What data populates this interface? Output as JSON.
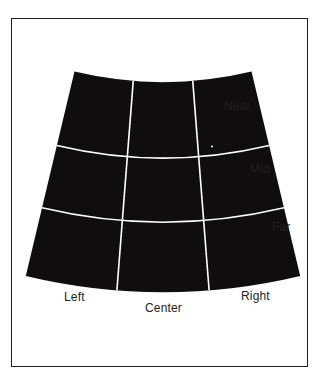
{
  "figure": {
    "frame": {
      "border_color": "#231f20",
      "background_color": "#ffffff"
    },
    "shape": {
      "fill_color": "#100d0e",
      "grid_line_color": "#ffffff",
      "grid_line_width": 1.6,
      "apex_x": 163,
      "apex_y": -300,
      "top_radius": 382,
      "arc1_radius": 458,
      "arc2_radius": 522,
      "bottom_radius": 592,
      "half_angle_deg": 13.4
    },
    "labels": {
      "depth": [
        {
          "id": "near",
          "text": "Near"
        },
        {
          "id": "mid",
          "text": "Mid"
        },
        {
          "id": "far",
          "text": "Far"
        }
      ],
      "lateral": [
        {
          "id": "left",
          "text": "Left"
        },
        {
          "id": "center",
          "text": "Center"
        },
        {
          "id": "right",
          "text": "Right"
        }
      ]
    },
    "zones": [
      {
        "row": "Near",
        "column": "Left"
      },
      {
        "row": "Near",
        "column": "Center"
      },
      {
        "row": "Near",
        "column": "Right"
      },
      {
        "row": "Mid",
        "column": "Left"
      },
      {
        "row": "Mid",
        "column": "Center"
      },
      {
        "row": "Mid",
        "column": "Right"
      },
      {
        "row": "Far",
        "column": "Left"
      },
      {
        "row": "Far",
        "column": "Center"
      },
      {
        "row": "Far",
        "column": "Right"
      }
    ]
  }
}
